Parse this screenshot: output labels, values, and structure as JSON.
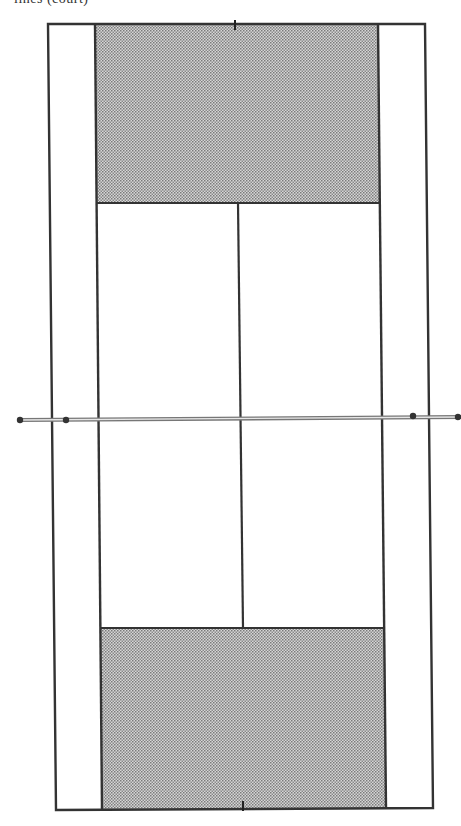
{
  "caption": {
    "text": "lines (court)",
    "note": "caption clipped at top edge; only lower fragments visible"
  },
  "diagram": {
    "colors": {
      "line": "#333333",
      "shade": "#b8b8b8",
      "background": "#ffffff",
      "net": "#888888",
      "post": "#333333"
    },
    "outer_boundary": {
      "top_left": [
        48,
        24
      ],
      "top_right": [
        425,
        24
      ],
      "bottom_right": [
        433,
        808
      ],
      "bottom_left": [
        56,
        810
      ]
    },
    "singles_sidelines": {
      "left": {
        "top": [
          95,
          24
        ],
        "bottom": [
          102,
          810
        ]
      },
      "right": {
        "top": [
          378,
          24
        ],
        "bottom": [
          386,
          808
        ]
      }
    },
    "shaded_areas": [
      {
        "name": "top-backcourt",
        "points": [
          [
            95,
            24
          ],
          [
            378,
            24
          ],
          [
            379,
            203
          ],
          [
            97,
            203
          ]
        ]
      },
      {
        "name": "bottom-backcourt",
        "points": [
          [
            101,
            628
          ],
          [
            385,
            628
          ],
          [
            386,
            808
          ],
          [
            102,
            810
          ]
        ]
      }
    ],
    "service_lines": [
      {
        "name": "top-service-line",
        "from": [
          97,
          203
        ],
        "to": [
          379,
          203
        ]
      },
      {
        "name": "bottom-service-line",
        "from": [
          101,
          628
        ],
        "to": [
          385,
          628
        ]
      }
    ],
    "center_service_line": {
      "from": [
        238,
        203
      ],
      "to": [
        243,
        628
      ]
    },
    "center_marks": [
      {
        "name": "top-center-mark",
        "at": [
          235,
          24
        ]
      },
      {
        "name": "bottom-center-mark",
        "at": [
          243,
          807
        ]
      }
    ],
    "net": {
      "from": [
        20,
        420
      ],
      "to": [
        461,
        417
      ],
      "posts": [
        [
          20,
          420
        ],
        [
          66,
          420
        ],
        [
          413,
          416
        ],
        [
          458,
          417
        ]
      ]
    }
  }
}
